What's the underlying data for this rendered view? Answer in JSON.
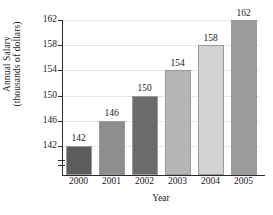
{
  "chart_data": {
    "type": "bar",
    "title": "",
    "categories": [
      "2000",
      "2001",
      "2002",
      "2003",
      "2004",
      "2005"
    ],
    "values": [
      142,
      146,
      150,
      154,
      158,
      162
    ],
    "value_labels": [
      "142",
      "146",
      "150",
      "154",
      "158",
      "162"
    ],
    "xlabel": "Year",
    "ylabel_line1": "Annual Salary",
    "ylabel_line2": "(thousands of dollars)",
    "ylim": [
      138,
      162
    ],
    "yticks": [
      142,
      146,
      150,
      154,
      158,
      162
    ],
    "ytick_labels": [
      "142",
      "146",
      "150",
      "154",
      "158",
      "162"
    ],
    "grid": true,
    "grid_axis": "y",
    "legend": "none",
    "axis_break": true,
    "bar_colors": [
      "#5c5c5c",
      "#8e8e8e",
      "#6b6b6b",
      "#b5b5b5",
      "#d2d2d2",
      "#9b9b9b"
    ],
    "axis_color": "#2b2b2b",
    "grid_color": "#e6e6e6",
    "background": "#ffffff"
  }
}
